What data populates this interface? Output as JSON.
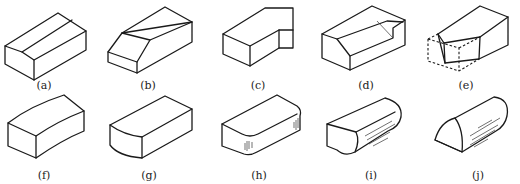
{
  "figure": {
    "items": [
      {
        "id": "a",
        "label": "(a)",
        "shape": "block-with-gabled-top"
      },
      {
        "id": "b",
        "label": "(b)",
        "shape": "block-with-chamfered-front-edge"
      },
      {
        "id": "c",
        "label": "(c)",
        "shape": "L-shaped-block-with-notch"
      },
      {
        "id": "d",
        "label": "(d)",
        "shape": "block-with-chamfered-groove"
      },
      {
        "id": "e",
        "label": "(e)",
        "shape": "block-with-cut-corner-dashed-removed-volume"
      },
      {
        "id": "f",
        "label": "(f)",
        "shape": "curved-block"
      },
      {
        "id": "g",
        "label": "(g)",
        "shape": "block-with-rounded-front-edge"
      },
      {
        "id": "h",
        "label": "(h)",
        "shape": "block-with-filleted-vertical-edges"
      },
      {
        "id": "i",
        "label": "(i)",
        "shape": "block-with-rounded-end"
      },
      {
        "id": "j",
        "label": "(j)",
        "shape": "half-cylinder"
      }
    ]
  }
}
